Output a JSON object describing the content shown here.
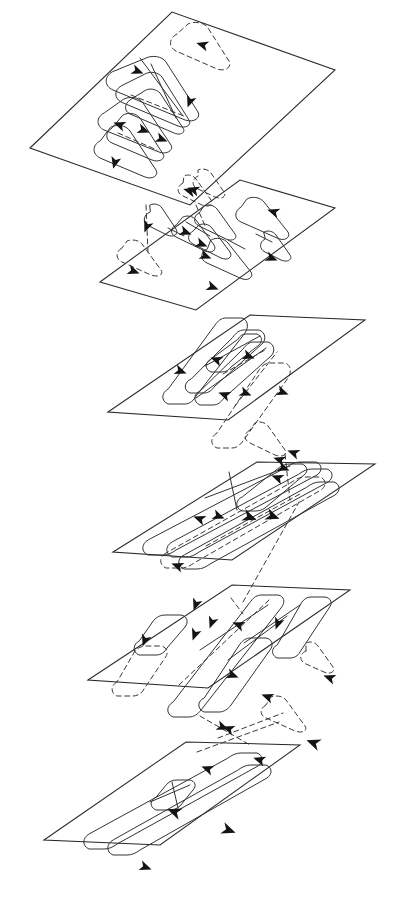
{
  "figure": {
    "background_color": "#ffffff",
    "line_color": "#2a2a2a",
    "dashed_line_color": "#3a3a3a",
    "arrow_color": "#141414",
    "layer_count": 6,
    "projection": "oblique-parallelogram",
    "layers": [
      {
        "id": "layer-1",
        "label": "Layer 1",
        "plane": "30,148 172,12 335,70 190,205",
        "tracks": [
          {
            "style": "solid",
            "d": "M112,72 C105,76 104,85 112,89 L186,119 C195,122 202,118 199,112 L166,61 C162,55 152,54 146,57 Z"
          },
          {
            "style": "solid",
            "d": "M119,86 C112,90 112,98 119,101 L179,125 C187,128 193,124 190,119 L162,76 C158,71 150,70 145,73 Z"
          },
          {
            "style": "solid",
            "d": "M127,100 C121,104 121,111 127,114 L175,133 C182,136 187,132 184,128 L160,92 C156,88 150,87 146,89 Z"
          },
          {
            "style": "solid",
            "d": "M103,112 C96,116 95,125 103,129 L160,151 C168,154 175,150 172,145 L144,102 C140,96 130,95 124,98 Z"
          },
          {
            "style": "solid",
            "d": "M110,127 C103,131 103,139 110,142 L153,159 C161,162 167,158 164,153 L141,117 C137,112 129,111 124,114 Z"
          },
          {
            "style": "solid",
            "d": "M98,139 C91,144 91,153 98,157 L146,176 C154,179 160,175 157,170 L131,130 C127,124 118,123 112,126 Z"
          },
          {
            "style": "dashed",
            "d": "M178,34 C170,38 169,47 177,51 L218,68 C227,71 233,67 230,61 L209,28 C205,22 195,21 189,24 Z"
          },
          {
            "style": "dashed",
            "d": "M133,93 L186,114"
          }
        ],
        "arrows": [
          {
            "x": 137,
            "y": 71,
            "angle": 22
          },
          {
            "x": 190,
            "y": 101,
            "angle": 110
          },
          {
            "x": 120,
            "y": 125,
            "angle": 200
          },
          {
            "x": 143,
            "y": 130,
            "angle": 20
          },
          {
            "x": 161,
            "y": 139,
            "angle": 22
          },
          {
            "x": 115,
            "y": 162,
            "angle": 105
          },
          {
            "x": 203,
            "y": 45,
            "angle": 196
          },
          {
            "x": 190,
            "y": 191,
            "angle": 196
          }
        ]
      },
      {
        "id": "layer-2",
        "label": "Layer 2",
        "plane": "100,282 240,180 335,208 196,310",
        "tracks": [
          {
            "style": "solid",
            "d": "M150,212 C144,215 143,222 149,225 L167,234 C174,237 179,233 176,229 L162,208 C159,204 154,203 150,205 Z"
          },
          {
            "style": "solid",
            "d": "M176,224 C171,227 171,233 177,236 L206,250 C213,253 218,249 215,245 L196,219 C193,215 187,214 183,216 Z"
          },
          {
            "style": "solid",
            "d": "M198,212 C192,215 192,222 198,225 L226,238 C233,241 238,237 235,233 L217,208 C214,204 208,203 204,205 Z"
          },
          {
            "style": "solid",
            "d": "M192,230 C186,234 186,241 193,244 L222,257 C229,260 234,256 231,252 L212,227 C209,223 202,222 198,224 Z"
          },
          {
            "style": "solid",
            "d": "M241,206 C234,210 234,218 241,221 L277,237 C285,241 291,236 288,231 L265,201 C261,196 252,195 247,198 Z"
          },
          {
            "style": "solid",
            "d": "M207,247 C200,251 200,259 207,262 L240,277 C248,281 254,276 251,271 L229,242 C225,237 217,236 212,239 Z"
          },
          {
            "style": "solid",
            "d": "M264,238 C258,241 258,248 264,251 L281,259 C288,262 293,258 290,254 L276,234 C273,230 268,229 264,231 Z"
          },
          {
            "style": "dashed",
            "d": "M123,247 C117,250 116,258 123,261 L152,274 C160,277 165,273 162,269 L143,243 C140,239 133,238 128,240 Z"
          },
          {
            "style": "dashed",
            "d": "M183,182 C177,185 176,192 183,195 L202,204 C209,207 214,203 211,199 L196,178 C193,174 188,173 184,175 Z"
          },
          {
            "style": "dashed",
            "d": "M146,204 L151,252"
          }
        ],
        "arrows": [
          {
            "x": 147,
            "y": 226,
            "angle": 112
          },
          {
            "x": 185,
            "y": 232,
            "angle": 20
          },
          {
            "x": 201,
            "y": 244,
            "angle": 22
          },
          {
            "x": 205,
            "y": 256,
            "angle": 22
          },
          {
            "x": 274,
            "y": 212,
            "angle": 198
          },
          {
            "x": 271,
            "y": 258,
            "angle": 22
          },
          {
            "x": 212,
            "y": 287,
            "angle": 20
          },
          {
            "x": 133,
            "y": 271,
            "angle": 20
          },
          {
            "x": 194,
            "y": 190,
            "angle": 198
          }
        ]
      },
      {
        "id": "layer-3",
        "label": "Layer 3",
        "plane": "108,412 250,315 365,320 228,420",
        "tracks": [
          {
            "style": "solid",
            "d": "M167,388 C160,392 160,400 167,403 L243,330 C250,326 250,318 243,315 Z"
          },
          {
            "style": "solid",
            "d": "M190,378 C184,381 183,389 190,392 L262,341 C269,338 269,330 262,327 Z"
          },
          {
            "style": "solid",
            "d": "M199,390 C193,393 192,400 199,403 L271,353 C278,350 278,342 271,339 Z"
          },
          {
            "style": "solid",
            "d": "M210,358 C205,361 204,367 210,370 L258,343 C264,340 264,334 258,331 Z"
          },
          {
            "style": "dashed",
            "d": "M216,432 C210,435 209,442 216,445 L286,374 C293,371 293,363 286,360 Z"
          },
          {
            "style": "dashed",
            "d": "M236,404 L278,350"
          },
          {
            "style": "dashed",
            "d": "M222,372 L266,349"
          }
        ],
        "arrows": [
          {
            "x": 217,
            "y": 360,
            "angle": 200
          },
          {
            "x": 248,
            "y": 356,
            "angle": 20
          },
          {
            "x": 180,
            "y": 371,
            "angle": 20
          },
          {
            "x": 225,
            "y": 395,
            "angle": 200
          },
          {
            "x": 245,
            "y": 393,
            "angle": 22
          },
          {
            "x": 282,
            "y": 392,
            "angle": 20
          },
          {
            "x": 280,
            "y": 460,
            "angle": 198
          },
          {
            "x": 278,
            "y": 478,
            "angle": 200
          }
        ]
      },
      {
        "id": "layer-4",
        "label": "Layer 4",
        "plane": "113,552 257,462 375,464 232,560",
        "tracks": [
          {
            "style": "solid",
            "d": "M147,539 C140,543 140,551 147,554 L315,473 C322,470 322,462 315,459 Z"
          },
          {
            "style": "solid",
            "d": "M170,540 C163,544 163,551 170,555 L326,480 C333,477 333,469 326,466 Z"
          },
          {
            "style": "solid",
            "d": "M182,553 C175,556 175,564 182,567 L333,493 C340,490 340,482 333,479 Z"
          },
          {
            "style": "solid",
            "d": "M241,496 C235,499 234,506 241,509 L302,473 C308,470 308,463 302,460 Z"
          },
          {
            "style": "dashed",
            "d": "M165,552 C158,556 158,564 165,567 L319,487 C326,484 326,476 319,473 Z"
          },
          {
            "style": "dashed",
            "d": "M205,545 L300,492"
          },
          {
            "style": "dashed",
            "d": "M242,600 L300,500"
          }
        ],
        "arrows": [
          {
            "x": 200,
            "y": 519,
            "angle": 200
          },
          {
            "x": 218,
            "y": 516,
            "angle": 20
          },
          {
            "x": 249,
            "y": 517,
            "angle": 20
          },
          {
            "x": 272,
            "y": 516,
            "angle": 20
          },
          {
            "x": 294,
            "y": 453,
            "angle": 200
          },
          {
            "x": 283,
            "y": 468,
            "angle": 22
          },
          {
            "x": 178,
            "y": 566,
            "angle": 200
          }
        ]
      },
      {
        "id": "layer-5",
        "label": "Layer 5",
        "plane": "88,680 232,585 350,590 208,688",
        "tracks": [
          {
            "style": "solid",
            "d": "M138,640 C132,643 131,651 138,654 L165,634 C171,631 171,624 165,621 Z"
          },
          {
            "style": "solid",
            "d": "M172,700 C166,704 165,712 172,715 L250,610 C257,606 257,598 250,595 Z"
          },
          {
            "style": "solid",
            "d": "M203,696 C196,699 196,707 203,710 L243,646 C250,643 250,636 243,633 Z"
          },
          {
            "style": "solid",
            "d": "M276,643 C270,646 270,653 276,656 L310,605 C317,602 317,594 310,591 Z"
          },
          {
            "style": "dashed",
            "d": "M116,681 C110,684 109,692 116,695 L151,647 C158,644 158,636 151,633 Z"
          },
          {
            "style": "dashed",
            "d": "M178,684 L268,598"
          },
          {
            "style": "dashed",
            "d": "M200,660 L265,612"
          }
        ],
        "arrows": [
          {
            "x": 145,
            "y": 640,
            "angle": 110
          },
          {
            "x": 196,
            "y": 604,
            "angle": 110
          },
          {
            "x": 212,
            "y": 622,
            "angle": 110
          },
          {
            "x": 239,
            "y": 625,
            "angle": 200
          },
          {
            "x": 278,
            "y": 623,
            "angle": 110
          },
          {
            "x": 232,
            "y": 675,
            "angle": 20
          },
          {
            "x": 330,
            "y": 678,
            "angle": 200
          }
        ]
      },
      {
        "id": "layer-6",
        "label": "Layer 6",
        "plane": "44,840 186,742 300,745 160,845",
        "tracks": [
          {
            "style": "solid",
            "d": "M88,833 C81,837 81,845 88,848 L256,764 C263,761 263,753 256,750 Z"
          },
          {
            "style": "solid",
            "d": "M112,838 C105,842 105,850 112,853 L265,776 C272,773 272,765 265,762 Z"
          },
          {
            "style": "solid",
            "d": "M155,795 C149,798 148,805 155,808 L189,786 C195,783 195,776 189,773 Z"
          },
          {
            "style": "dashed",
            "d": "M196,750 L278,722"
          }
        ],
        "arrows": [
          {
            "x": 175,
            "y": 812,
            "angle": 200
          },
          {
            "x": 228,
            "y": 830,
            "angle": 20
          },
          {
            "x": 145,
            "y": 867,
            "angle": 20
          },
          {
            "x": 208,
            "y": 769,
            "angle": 200
          },
          {
            "x": 260,
            "y": 760,
            "angle": 198
          }
        ]
      }
    ]
  }
}
